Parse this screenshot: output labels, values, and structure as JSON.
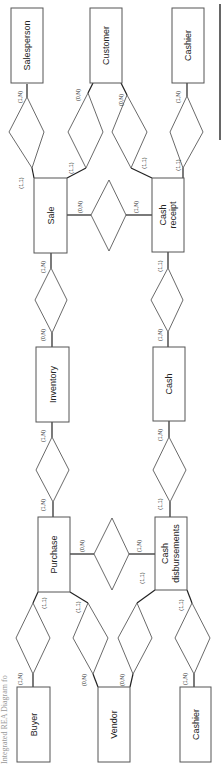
{
  "caption": "Integrated REA Diagram fo",
  "orientation": "rotated 90 degrees counter-clockwise",
  "entities": {
    "salesperson": "Salesperson",
    "customer": "Customer",
    "cashier_top": "Cashier",
    "sale": "Sale",
    "cash_receipt_1": "Cash",
    "cash_receipt_2": "receipt",
    "inventory": "Inventory",
    "cash": "Cash",
    "purchase": "Purchase",
    "cash_disb_1": "Cash",
    "cash_disb_2": "disbursements",
    "buyer": "Buyer",
    "vendor": "Vendor",
    "cashier_bottom": "Cashier"
  },
  "cardinalities": {
    "salesperson_side": "(1,N)",
    "sale_salesperson": "(1,1)",
    "customer_sale_side": "(0,N)",
    "sale_customer": "(1,1)",
    "customer_cr_side": "(0,N)",
    "cr_customer": "(1,1)",
    "cashier_top_side": "(1,N)",
    "cr_cashier": "(1,1)",
    "sale_cr": "(0,N)",
    "cr_sale": "(1,N)",
    "sale_inventory": "(1,N)",
    "inventory_sale": "(0,N)",
    "cr_cash": "(1,1)",
    "cash_cr": "(1,N)",
    "inventory_purchase": "(1,N)",
    "purchase_inventory": "(1,N)",
    "cash_cd": "(1,N)",
    "cd_cash": "(1,1)",
    "purchase_cd": "(0,N)",
    "cd_purchase": "(1,N)",
    "purchase_buyer": "(1,1)",
    "buyer_side": "(1,N)",
    "purchase_vendor": "(1,1)",
    "vendor_purchase": "(0,N)",
    "cd_vendor": "(1,1)",
    "vendor_cd": "(0,N)",
    "cd_cashier": "(1,1)",
    "cashier_bottom_side": "(1,N)"
  }
}
